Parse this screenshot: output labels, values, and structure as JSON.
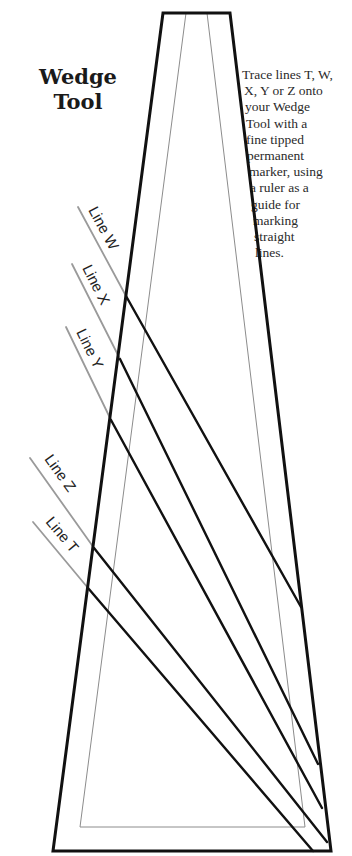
{
  "title": {
    "line1": "Wedge",
    "line2": "Tool"
  },
  "instructions": {
    "lines": [
      "Trace lines T, W,",
      "X, Y or Z onto",
      "your Wedge",
      "Tool with a",
      "fine tipped",
      "permanent",
      "marker, using",
      "a ruler as a",
      "guide for",
      "marking",
      "straight",
      "lines."
    ],
    "indents": [
      0,
      2,
      3,
      4,
      4,
      5,
      7,
      8,
      9,
      11,
      12,
      13
    ]
  },
  "lines": [
    {
      "id": "W",
      "label": "Line W"
    },
    {
      "id": "X",
      "label": "Line X"
    },
    {
      "id": "Y",
      "label": "Line Y"
    },
    {
      "id": "Z",
      "label": "Line Z"
    },
    {
      "id": "T",
      "label": "Line T"
    }
  ],
  "colors": {
    "outline": "#111111",
    "guide": "#9a9a9a",
    "inner": "#8c8c8c",
    "text": "#222222"
  }
}
